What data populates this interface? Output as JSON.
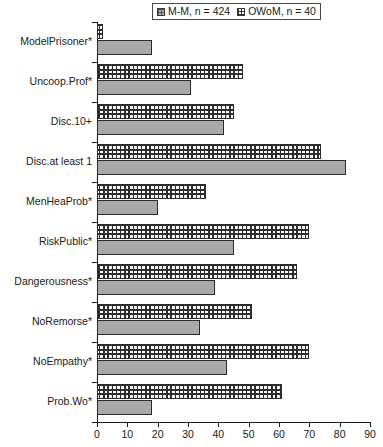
{
  "legend": {
    "position": "top-center",
    "entries": [
      {
        "label": "M-M, n = 424",
        "swatch": "mm-gray-dotted-swatch"
      },
      {
        "label": "OWoM, n = 40",
        "swatch": "owom-checkered-swatch"
      }
    ]
  },
  "top_crop_artifact": "",
  "colors": {
    "mm_bar": "#a9a9a9",
    "owom_bar": "#ffffff",
    "axis": "#1a1a1a",
    "border": "#2b2b2b"
  },
  "chart_data": {
    "type": "bar",
    "orientation": "horizontal",
    "title": "",
    "xlabel": "",
    "ylabel": "",
    "xlim": [
      0,
      90
    ],
    "xticks": [
      0,
      10,
      20,
      30,
      40,
      50,
      60,
      70,
      80,
      90
    ],
    "grid": false,
    "legend_position": "top-center",
    "categories": [
      "ModelPrisoner*",
      "Uncoop.Prof*",
      "Disc.10+",
      "Disc.at least 1",
      "MenHeaProb*",
      "RiskPublic*",
      "Dangerousness*",
      "NoRemorse*",
      "NoEmpathy*",
      "Prob.Wo*"
    ],
    "series": [
      {
        "name": "OWoM, n = 40",
        "style": "checkered",
        "values": [
          2,
          48,
          45,
          74,
          36,
          70,
          66,
          51,
          70,
          61
        ]
      },
      {
        "name": "M-M, n = 424",
        "style": "solid-gray",
        "values": [
          18,
          31,
          42,
          82,
          20,
          45,
          39,
          34,
          43,
          18
        ]
      }
    ]
  }
}
